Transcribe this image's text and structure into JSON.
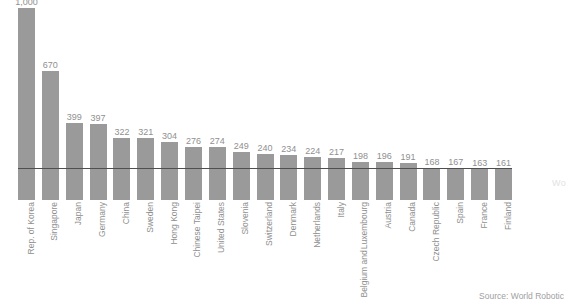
{
  "chart_data": {
    "type": "bar",
    "title": "",
    "subtitle": "",
    "xlabel": "",
    "ylabel": "",
    "ylim": [
      0,
      1000
    ],
    "grid": false,
    "legend": null,
    "orientation": "vertical",
    "bar_color": "#9a9a9a",
    "value_label_color": "#909090",
    "categories": [
      "Rep. of Korea",
      "Singapore",
      "Japan",
      "Germany",
      "China",
      "Sweden",
      "Hong Kong",
      "Chinese Taipei",
      "United States",
      "Slovenia",
      "Switzerland",
      "Denmark",
      "Netherlands",
      "Italy",
      "Belgium and Luxembourg",
      "Austria",
      "Canada",
      "Czech Republic",
      "Spain",
      "France",
      "Finland"
    ],
    "category_lines": [
      [
        "Rep. of Korea"
      ],
      [
        "Singapore"
      ],
      [
        "Japan"
      ],
      [
        "Germany"
      ],
      [
        "China"
      ],
      [
        "Sweden"
      ],
      [
        "Hong Kong"
      ],
      [
        "Chinese Taipei"
      ],
      [
        "United States"
      ],
      [
        "Slovenia"
      ],
      [
        "Switzerland"
      ],
      [
        "Denmark"
      ],
      [
        "Netherlands"
      ],
      [
        "Italy"
      ],
      [
        "Belgium and",
        "Luxembourg"
      ],
      [
        "Austria"
      ],
      [
        "Canada"
      ],
      [
        "Czech Republic"
      ],
      [
        "Spain"
      ],
      [
        "France"
      ],
      [
        "Finland"
      ]
    ],
    "values": [
      1000,
      670,
      399,
      397,
      322,
      321,
      304,
      276,
      274,
      249,
      240,
      234,
      224,
      217,
      198,
      196,
      191,
      168,
      167,
      163,
      161
    ],
    "value_labels": [
      "1,000",
      "670",
      "399",
      "397",
      "322",
      "321",
      "304",
      "276",
      "274",
      "249",
      "240",
      "234",
      "224",
      "217",
      "198",
      "196",
      "191",
      "168",
      "167",
      "163",
      "161"
    ],
    "annotations": {
      "reference_line_value": 165
    }
  },
  "footer": {
    "source": "Source: World Robotic"
  },
  "watermark": {
    "text": "Wo"
  }
}
